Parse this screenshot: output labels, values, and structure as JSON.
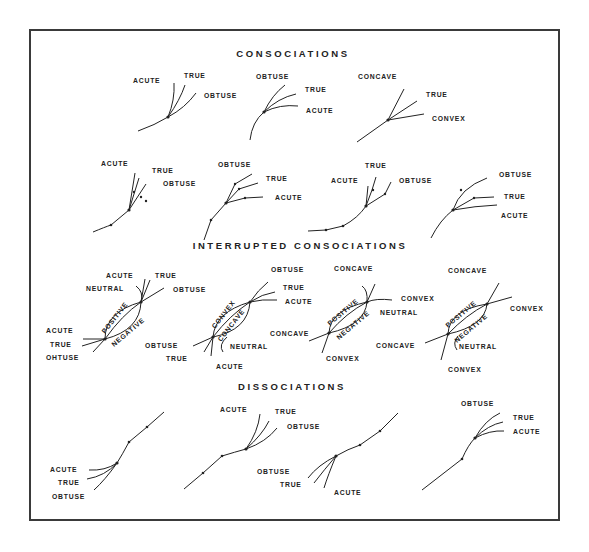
{
  "sections": {
    "consociations": "CONSOCIATIONS",
    "interrupted": "INTERRUPTED CONSOCIATIONS",
    "dissociations": "DISSOCIATIONS"
  },
  "consociations_row1": [
    {
      "labels": [
        "ACUTE",
        "TRUE",
        "OBTUSE"
      ]
    },
    {
      "labels": [
        "OBTUSE",
        "TRUE",
        "ACUTE"
      ]
    },
    {
      "labels": [
        "CONCAVE",
        "TRUE",
        "CONVEX"
      ]
    }
  ],
  "consociations_row2": [
    {
      "labels": [
        "ACUTE",
        "TRUE",
        "OBTUSE"
      ]
    },
    {
      "labels": [
        "OBTUSE",
        "TRUE",
        "ACUTE"
      ]
    },
    {
      "labels": [
        "TRUE",
        "ACUTE",
        "OBTUSE"
      ]
    },
    {
      "labels": [
        "OBTUSE",
        "TRUE",
        "ACUTE"
      ]
    }
  ],
  "interrupted": [
    {
      "top_labels": [
        "ACUTE",
        "TRUE",
        "NEUTRAL",
        "OBTUSE"
      ],
      "arc_upper": "POSITIVE",
      "arc_lower": "NEGATIVE",
      "bottom_labels": [
        "ACUTE",
        "TRUE",
        "OHTUSE"
      ]
    },
    {
      "top_labels": [
        "OBTUSE",
        "TRUE",
        "ACUTE"
      ],
      "arc_upper": "CONVEX",
      "arc_lower": "CONCAVE",
      "bottom_labels": [
        "OBTUSE",
        "TRUE",
        "NEUTRAL",
        "ACUTE"
      ]
    },
    {
      "top_labels": [
        "CONCAVE",
        "CONVEX",
        "NEUTRAL"
      ],
      "arc_upper": "POSITIVE",
      "arc_lower": "NEGATIVE",
      "bottom_labels": [
        "CONCAVE",
        "CONVEX"
      ]
    },
    {
      "top_labels": [
        "CONCAVE",
        "CONVEX"
      ],
      "arc_upper": "POSITIVE",
      "arc_lower": "NEGATIVE",
      "bottom_labels": [
        "CONCAVE",
        "NEUTRAL",
        "CONVEX"
      ]
    }
  ],
  "dissociations": [
    {
      "labels": [
        "ACUTE",
        "TRUE",
        "OBTUSE"
      ]
    },
    {
      "labels": [
        "ACUTE",
        "TRUE",
        "OBTUSE"
      ]
    },
    {
      "labels": [
        "OBTUSE",
        "TRUE",
        "ACUTE"
      ]
    },
    {
      "labels": [
        "OBTUSE",
        "TRUE",
        "ACUTE"
      ]
    }
  ]
}
